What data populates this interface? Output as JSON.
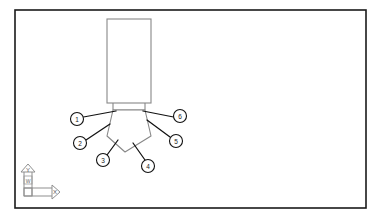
{
  "drawing": {
    "background_color": "#ffffff",
    "border": {
      "name": "drawing-frame",
      "color": "#1a1a1a",
      "x": 15,
      "y": 10,
      "width": 351,
      "height": 198
    },
    "geometry": {
      "line_color": "#888888",
      "body_rect": {
        "label": "extruded-block",
        "x": 107,
        "y": 19,
        "width": 44,
        "height": 84
      },
      "neck": {
        "label": "neck",
        "left_x": 113,
        "right_x": 145,
        "top_y": 103,
        "bottom_y": 110
      },
      "pentagon": {
        "label": "pentagon-base",
        "points": "113,110 145,110 151,136 125,152 107,136"
      }
    },
    "leader_color": "#111111",
    "balloons": [
      {
        "id": "balloon-1",
        "label": "1",
        "cx": 77,
        "cy": 119,
        "r": 6.5,
        "leader_x": 83.5,
        "leader_y": 117,
        "anchor_x": 116,
        "anchor_y": 111
      },
      {
        "id": "balloon-2",
        "label": "2",
        "cx": 80,
        "cy": 143,
        "r": 6.5,
        "leader_x": 86,
        "leader_y": 140,
        "anchor_x": 110,
        "anchor_y": 124
      },
      {
        "id": "balloon-3",
        "label": "3",
        "cx": 103,
        "cy": 160,
        "r": 6.5,
        "leader_x": 107,
        "leader_y": 155,
        "anchor_x": 118,
        "anchor_y": 140
      },
      {
        "id": "balloon-4",
        "label": "4",
        "cx": 148,
        "cy": 166,
        "r": 6.5,
        "leader_x": 145,
        "leader_y": 160,
        "anchor_x": 133,
        "anchor_y": 143
      },
      {
        "id": "balloon-5",
        "label": "5",
        "cx": 176,
        "cy": 141,
        "r": 6.5,
        "leader_x": 170,
        "leader_y": 137,
        "anchor_x": 147,
        "anchor_y": 120
      },
      {
        "id": "balloon-6",
        "label": "6",
        "cx": 180,
        "cy": 116,
        "r": 6.5,
        "leader_x": 173.5,
        "leader_y": 117,
        "anchor_x": 143,
        "anchor_y": 111
      }
    ],
    "ucs_icon": {
      "name": "ucs-coordinate-axis-icon",
      "origin_x": 28,
      "origin_y": 196,
      "y_axis_label": "Y",
      "x_axis_label": "X",
      "world_mark": "W",
      "stroke_color": "#888888"
    }
  }
}
